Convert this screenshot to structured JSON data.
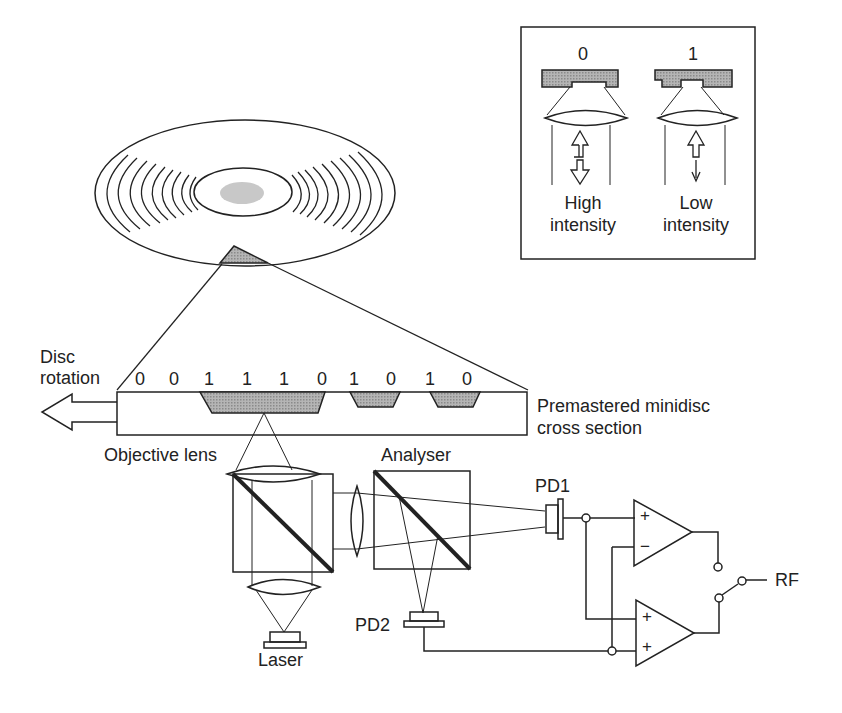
{
  "inset": {
    "left": {
      "bit": "0",
      "caption_line1": "High",
      "caption_line2": "intensity"
    },
    "right": {
      "bit": "1",
      "caption_line1": "Low",
      "caption_line2": "intensity"
    }
  },
  "disc": {
    "rotation_line1": "Disc",
    "rotation_line2": "rotation"
  },
  "cross_section": {
    "bits": [
      "0",
      "0",
      "1",
      "1",
      "1",
      "0",
      "1",
      "0",
      "1",
      "0"
    ],
    "label_line1": "Premastered minidisc",
    "label_line2": "cross section"
  },
  "optics": {
    "objective_lens": "Objective lens",
    "analyser": "Analyser",
    "laser": "Laser",
    "pd1": "PD1",
    "pd2": "PD2"
  },
  "circuit": {
    "amp1_plus": "+",
    "amp1_minus": "−",
    "amp2_plus_a": "+",
    "amp2_plus_b": "+",
    "output": "RF"
  },
  "colors": {
    "line": "#222222",
    "fill": "#9a9a9a",
    "background": "#ffffff"
  }
}
